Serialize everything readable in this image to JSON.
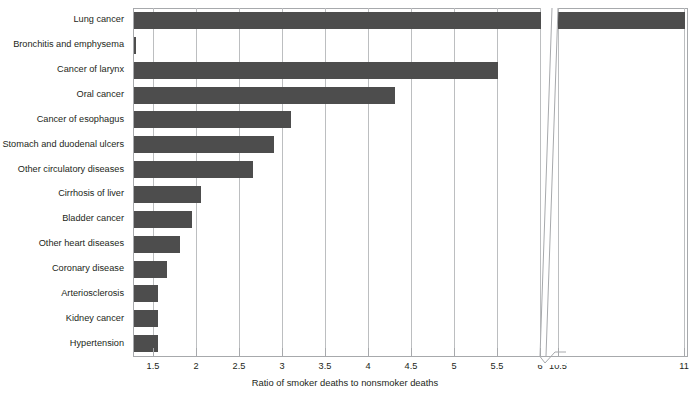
{
  "chart_data": {
    "type": "bar",
    "orientation": "horizontal",
    "title": "",
    "xlabel": "Ratio of smoker deaths to nonsmoker deaths",
    "ylabel": "",
    "categories": [
      "Lung cancer",
      "Bronchitis and emphysema",
      "Cancer of larynx",
      "Oral cancer",
      "Cancer of esophagus",
      "Stomach and duodenal ulcers",
      "Other circulatory diseases",
      "Cirrhosis of liver",
      "Bladder cancer",
      "Other heart diseases",
      "Coronary disease",
      "Arteriosclerosis",
      "Kidney cancer",
      "Hypertension"
    ],
    "values": [
      11.0,
      6.2,
      5.5,
      4.3,
      3.1,
      2.9,
      2.65,
      2.05,
      1.95,
      1.8,
      1.65,
      1.55,
      1.55,
      1.55
    ],
    "xtick_labels": [
      "1.5",
      "2",
      "2.5",
      "3",
      "3.5",
      "4",
      "4.5",
      "5",
      "5.5",
      "6",
      "10.5",
      "11"
    ],
    "xtick_values": [
      1.5,
      2,
      2.5,
      3,
      3.5,
      4,
      4.5,
      5,
      5.5,
      6,
      10.5,
      11
    ],
    "xlim": [
      1.27,
      11.0
    ],
    "axis_break": {
      "present": true,
      "after_value": 6,
      "resume_value": 10.5
    },
    "grid": "vertical",
    "legend": "none",
    "bar_color": "#4d4d4d",
    "grid_color": "#bcbec0",
    "axis_color": "#a7a9ac"
  }
}
